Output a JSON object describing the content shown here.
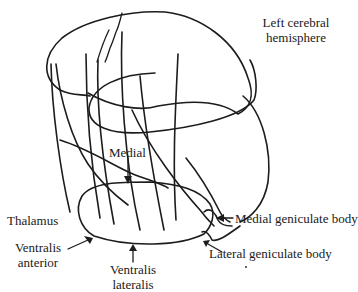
{
  "diagram": {
    "labels": {
      "hemisphere_line1": "Left cerebral",
      "hemisphere_line2": "hemisphere",
      "medial": "Medial",
      "thalamus": "Thalamus",
      "ventralis_anterior_line1": "Ventralis",
      "ventralis_anterior_line2": "anterior",
      "ventralis_lateralis_line1": "Ventralis",
      "ventralis_lateralis_line2": "lateralis",
      "medial_geniculate": "Medial geniculate body",
      "lateral_geniculate": "Lateral geniculate body"
    },
    "colors": {
      "line": "#1c1c1c",
      "background": "#ffffff",
      "text": "#1a1a1a"
    }
  }
}
